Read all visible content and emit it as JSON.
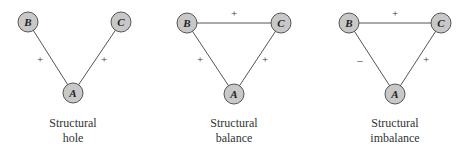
{
  "diagrams": [
    {
      "caption_line1": "Structural",
      "caption_line2": "hole",
      "nodes": {
        "B": "B",
        "C": "C",
        "A": "A"
      },
      "edges": {
        "AB": "+",
        "AC": "+"
      }
    },
    {
      "caption_line1": "Structural",
      "caption_line2": "balance",
      "nodes": {
        "B": "B",
        "C": "C",
        "A": "A"
      },
      "edges": {
        "BC": "+",
        "AB": "+",
        "AC": "+"
      }
    },
    {
      "caption_line1": "Structural",
      "caption_line2": "imbalance",
      "nodes": {
        "B": "B",
        "C": "C",
        "A": "A"
      },
      "edges": {
        "BC": "+",
        "AB": "–",
        "AC": "+"
      }
    }
  ],
  "colors": {
    "node_fill": "#c8c8c8",
    "edge": "#555555"
  }
}
